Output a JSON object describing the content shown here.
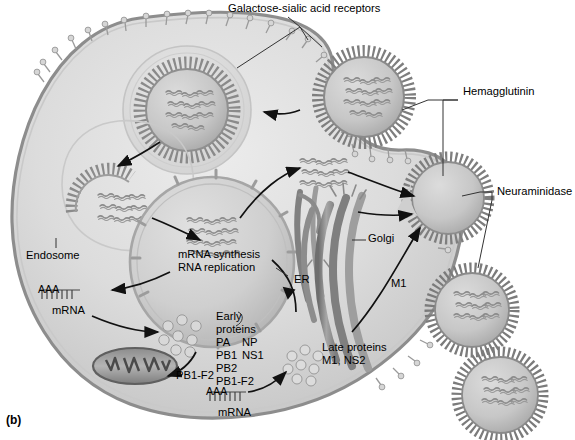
{
  "figure": {
    "panel_label": "(b)",
    "caption_labels": {
      "receptors": "Galactose-sialic acid receptors",
      "hemagglutinin": "Hemagglutinin",
      "neuraminidase": "Neuraminidase",
      "endosome": "Endosome",
      "nucleus_line1": "mRNA synthesis",
      "nucleus_line2": "RNA replication",
      "er": "ER",
      "golgi": "Golgi",
      "m1": "M1",
      "mrna_top": "mRNA",
      "mrna_bottom": "mRNA",
      "early_line1": "Early",
      "early_line2": "proteins",
      "early_row1_a": "PA",
      "early_row1_b": "NP",
      "early_row2_a": "PB1",
      "early_row2_b": "NS1",
      "early_row3": "PB2",
      "early_row4": "PB1-F2",
      "mito_label": "PB1-F2",
      "late_line1": "Late proteins",
      "late_line2": "M1, NS2",
      "poly_a_top": "AAA",
      "poly_t_top": "TTTTTTT",
      "poly_a_bottom": "AAA",
      "poly_t_bottom": "TTTTTTT"
    },
    "colors": {
      "background": "#ffffff",
      "cytoplasm_light": "#e3e3e3",
      "cytoplasm_mid": "#d2d2d2",
      "cytoplasm_dark": "#bdbdbd",
      "membrane": "#8f8f8f",
      "membrane_dark": "#6f6f6f",
      "nucleus_fill": "#cfcfcf",
      "nucleus_edge": "#a2a2a2",
      "organelle": "#9a9a9a",
      "organelle_dark": "#6b6b6b",
      "virion_core": "#c6c6c6",
      "virion_spikes": "#7a7a7a",
      "rnp": "#8a8a8a",
      "text": "#000000",
      "arrow": "#111111",
      "receptor": "#d0d0d0"
    }
  }
}
